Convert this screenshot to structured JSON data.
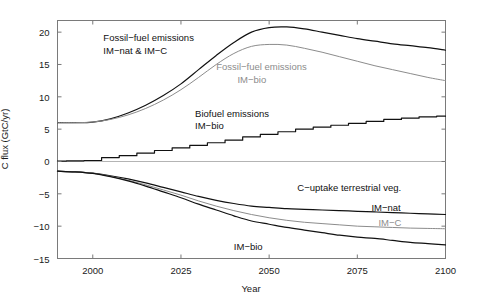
{
  "chart_data": {
    "type": "line",
    "title": "",
    "xlabel": "Year",
    "ylabel": "C flux (GtC/yr)",
    "xlim": [
      1990,
      2100
    ],
    "ylim": [
      -15,
      21.8
    ],
    "xticks": [
      2000,
      2025,
      2050,
      2075,
      2100
    ],
    "xtick_labels": [
      "2000",
      "2025",
      "2050",
      "2075",
      "2100"
    ],
    "yticks": [
      -15,
      -10,
      -5,
      0,
      5,
      10,
      15,
      20
    ],
    "ytick_labels": [
      "-15",
      "-10",
      "-5",
      "0",
      "5",
      "10",
      "15",
      "20"
    ],
    "grid": false,
    "legend_position": "inline-annotations",
    "colors": {
      "black": "#111111",
      "gray": "#8c8c8c",
      "axis": "#7a7a7a",
      "zero_line": "#b4b4b4"
    },
    "series": [
      {
        "name": "Fossil-fuel emissions IM-nat & IM-C",
        "color": "#111111",
        "x": [
          1990,
          1995,
          2000,
          2005,
          2010,
          2015,
          2020,
          2025,
          2030,
          2035,
          2040,
          2045,
          2050,
          2055,
          2060,
          2065,
          2070,
          2075,
          2080,
          2085,
          2090,
          2095,
          2100
        ],
        "values": [
          6.0,
          6.0,
          6.1,
          6.6,
          7.5,
          8.7,
          10.2,
          12.0,
          14.2,
          16.4,
          18.4,
          20.0,
          20.7,
          20.8,
          20.5,
          20.0,
          19.5,
          19.0,
          18.6,
          18.2,
          17.9,
          17.6,
          17.2
        ]
      },
      {
        "name": "Fossil-fuel emissions IM-bio",
        "color": "#8c8c8c",
        "x": [
          1990,
          1995,
          2000,
          2005,
          2010,
          2015,
          2020,
          2025,
          2030,
          2035,
          2040,
          2045,
          2050,
          2055,
          2060,
          2065,
          2070,
          2075,
          2080,
          2085,
          2090,
          2095,
          2100
        ],
        "values": [
          6.0,
          6.0,
          6.1,
          6.5,
          7.2,
          8.2,
          9.5,
          11.1,
          13.0,
          15.0,
          16.7,
          17.8,
          18.1,
          18.0,
          17.5,
          16.9,
          16.2,
          15.5,
          14.8,
          14.2,
          13.6,
          13.0,
          12.5
        ]
      },
      {
        "name": "Biofuel emissions IM-bio",
        "color": "#111111",
        "x": [
          1990,
          1995,
          2000,
          2005,
          2010,
          2015,
          2020,
          2025,
          2030,
          2035,
          2040,
          2045,
          2050,
          2055,
          2060,
          2065,
          2070,
          2075,
          2080,
          2085,
          2090,
          2095,
          2100
        ],
        "values": [
          0.05,
          0.1,
          0.15,
          0.6,
          0.9,
          1.3,
          1.7,
          2.1,
          2.5,
          2.9,
          3.3,
          3.8,
          4.2,
          4.6,
          5.0,
          5.3,
          5.6,
          5.9,
          6.2,
          6.5,
          6.7,
          6.9,
          7.0
        ]
      },
      {
        "name": "C-uptake terrestrial veg. IM-nat",
        "color": "#111111",
        "x": [
          1990,
          1995,
          2000,
          2005,
          2010,
          2015,
          2020,
          2025,
          2030,
          2035,
          2040,
          2045,
          2050,
          2055,
          2060,
          2065,
          2070,
          2075,
          2080,
          2085,
          2090,
          2095,
          2100
        ],
        "values": [
          -1.5,
          -1.6,
          -1.8,
          -2.2,
          -2.7,
          -3.3,
          -4.0,
          -4.7,
          -5.4,
          -6.0,
          -6.5,
          -6.9,
          -7.1,
          -7.3,
          -7.4,
          -7.5,
          -7.6,
          -7.7,
          -7.8,
          -7.9,
          -8.0,
          -8.1,
          -8.2
        ]
      },
      {
        "name": "C-uptake terrestrial veg. IM-C",
        "color": "#8c8c8c",
        "x": [
          1990,
          1995,
          2000,
          2005,
          2010,
          2015,
          2020,
          2025,
          2030,
          2035,
          2040,
          2045,
          2050,
          2055,
          2060,
          2065,
          2070,
          2075,
          2080,
          2085,
          2090,
          2095,
          2100
        ],
        "values": [
          -1.5,
          -1.6,
          -1.8,
          -2.3,
          -2.9,
          -3.6,
          -4.4,
          -5.2,
          -6.1,
          -6.9,
          -7.6,
          -8.2,
          -8.7,
          -9.1,
          -9.4,
          -9.6,
          -9.8,
          -10.0,
          -10.1,
          -10.2,
          -10.3,
          -10.35,
          -10.4
        ]
      },
      {
        "name": "C-uptake terrestrial veg. IM-bio",
        "color": "#111111",
        "x": [
          1990,
          1995,
          2000,
          2005,
          2010,
          2015,
          2020,
          2025,
          2030,
          2035,
          2040,
          2045,
          2050,
          2055,
          2060,
          2065,
          2070,
          2075,
          2080,
          2085,
          2090,
          2095,
          2100
        ],
        "values": [
          -1.5,
          -1.6,
          -1.85,
          -2.35,
          -3.0,
          -3.8,
          -4.7,
          -5.6,
          -6.6,
          -7.5,
          -8.4,
          -9.2,
          -9.7,
          -10.2,
          -10.6,
          -11.0,
          -11.4,
          -11.7,
          -11.9,
          -12.2,
          -12.5,
          -12.7,
          -12.9
        ]
      }
    ],
    "annotations": [
      {
        "text": "Fossil-fuel emissions",
        "color": "#111111",
        "x": 2003,
        "y": 19.3
      },
      {
        "text": "IM-nat & IM-C",
        "color": "#111111",
        "x": 2003,
        "y": 17.3
      },
      {
        "text": "Fossil-fuel emissions",
        "color": "#8c8c8c",
        "x": 2035,
        "y": 14.8
      },
      {
        "text": "IM-bio",
        "color": "#8c8c8c",
        "x": 2041,
        "y": 12.8
      },
      {
        "text": "Biofuel emissions",
        "color": "#111111",
        "x": 2029,
        "y": 7.5
      },
      {
        "text": "IM-bio",
        "color": "#111111",
        "x": 2029,
        "y": 5.6
      },
      {
        "text": "C-uptake terrestrial veg.",
        "color": "#111111",
        "x": 2058,
        "y": -4.0
      },
      {
        "text": "IM-nat",
        "color": "#111111",
        "x": 2079,
        "y": -7.0
      },
      {
        "text": "IM-C",
        "color": "#8c8c8c",
        "x": 2081,
        "y": -9.4
      },
      {
        "text": "IM-bio",
        "color": "#111111",
        "x": 2040,
        "y": -13.0
      }
    ],
    "zero_reference_line": 0
  }
}
